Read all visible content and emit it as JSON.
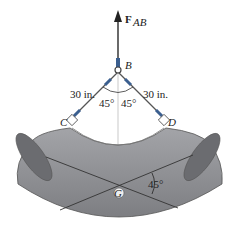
{
  "diagram": {
    "force_label": "F",
    "force_subscript": "AB",
    "points": {
      "B": "B",
      "C": "C",
      "D": "D",
      "G": "G"
    },
    "left_cable_length": "30 in.",
    "right_cable_length": "30 in.",
    "left_angle": "45°",
    "right_angle": "45°",
    "pipe_angle": "45°",
    "colors": {
      "pipe_fill": "#8e8f93",
      "pipe_dark": "#6b6c70",
      "cable": "#555555",
      "sleeve": "#3b5f8f"
    }
  }
}
